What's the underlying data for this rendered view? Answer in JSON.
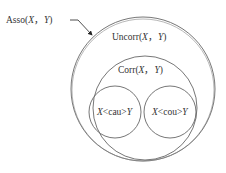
{
  "diagram": {
    "type": "nested-venn",
    "stroke_color": "#555555",
    "pointer_label": {
      "prefix": "Asso",
      "open": "(",
      "x": "X",
      "sep": "，",
      "y": "Y",
      "close": ")"
    },
    "sets": [
      {
        "id": "uncorr",
        "prefix": "Uncorr",
        "open": "(",
        "x": "X",
        "sep": "，",
        "y": "Y",
        "close": ")"
      },
      {
        "id": "corr",
        "prefix": "Corr",
        "open": "(",
        "x": "X",
        "sep": "，",
        "y": "Y",
        "close": ")"
      },
      {
        "id": "cau",
        "x": "X",
        "rel": "<cau>",
        "y": "Y"
      },
      {
        "id": "cou",
        "x": "X",
        "rel": "<cou>",
        "y": "Y"
      }
    ]
  }
}
